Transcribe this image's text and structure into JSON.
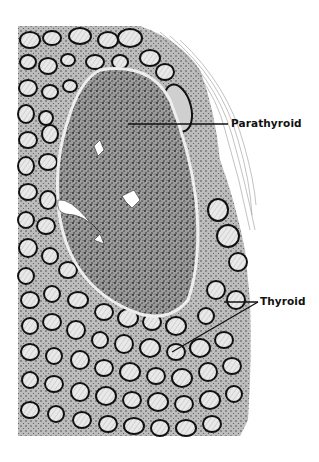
{
  "figure": {
    "labels": [
      {
        "id": "parathyroid",
        "text": "Parathyroid"
      },
      {
        "id": "thyroid",
        "text": "Thyroid"
      }
    ],
    "colors": {
      "background": "#ffffff",
      "ink": "#111111",
      "stipple": "#333333",
      "colloid": "#e8e8e8"
    }
  }
}
